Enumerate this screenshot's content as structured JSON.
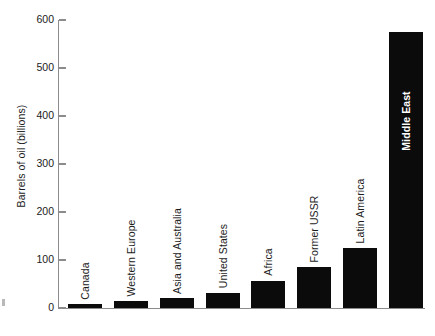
{
  "chart_data": {
    "type": "bar",
    "title": "",
    "subtitle": "",
    "xlabel": "",
    "ylabel": "Barrels of oil (billions)",
    "ylim": [
      0,
      600
    ],
    "ytick_values": [
      0,
      100,
      200,
      300,
      400,
      500,
      600
    ],
    "ytick_labels": [
      "0",
      "100",
      "200",
      "300",
      "400",
      "500",
      "600"
    ],
    "grid": false,
    "legend": null,
    "bar_color": "#0b0b0b",
    "axis_color": "#8c8c8c",
    "label_orientation": "vertical",
    "categories": [
      "Canada",
      "Western Europe",
      "Asia and Australia",
      "United States",
      "Africa",
      "Former USSR",
      "Latin America",
      "Middle East"
    ],
    "values": [
      8,
      15,
      20,
      32,
      57,
      85,
      125,
      575
    ],
    "bars": [
      {
        "label": "Canada",
        "value": 8,
        "label_placement": "above-bar",
        "label_color": "#1b1b1b"
      },
      {
        "label": "Western Europe",
        "value": 15,
        "label_placement": "above-bar",
        "label_color": "#1b1b1b"
      },
      {
        "label": "Asia and Australia",
        "value": 20,
        "label_placement": "above-bar",
        "label_color": "#1b1b1b"
      },
      {
        "label": "United States",
        "value": 32,
        "label_placement": "above-bar",
        "label_color": "#1b1b1b"
      },
      {
        "label": "Africa",
        "value": 57,
        "label_placement": "above-bar",
        "label_color": "#1b1b1b"
      },
      {
        "label": "Former USSR",
        "value": 85,
        "label_placement": "above-bar",
        "label_color": "#1b1b1b"
      },
      {
        "label": "Latin America",
        "value": 125,
        "label_placement": "above-bar",
        "label_color": "#1b1b1b"
      },
      {
        "label": "Middle East",
        "value": 575,
        "label_placement": "inside-bar",
        "label_color": "#ffffff"
      }
    ]
  }
}
